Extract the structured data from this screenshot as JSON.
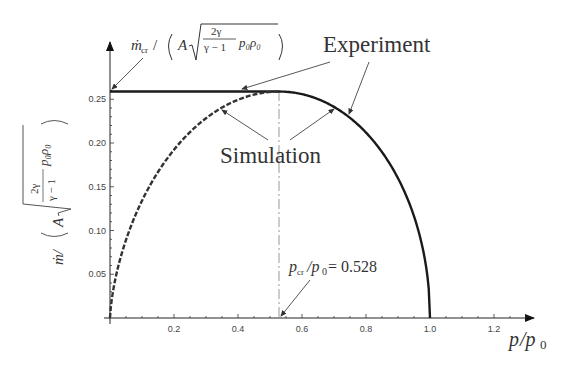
{
  "chart_data": {
    "type": "line",
    "title": "",
    "xlabel": "p/p0",
    "ylabel": "ṁ/(A√(2γ/(γ−1) p0 ρ0))",
    "xlim": [
      0,
      1.3
    ],
    "ylim": [
      0,
      0.27
    ],
    "x_ticks": [
      "0.2",
      "0.4",
      "0.6",
      "0.8",
      "1.0",
      "1.2"
    ],
    "y_ticks": [
      "0.05",
      "0.10",
      "0.15",
      "0.20",
      "0.25"
    ],
    "grid": false,
    "legend": "annotations",
    "series": [
      {
        "name": "Experiment",
        "style": "solid",
        "x": [
          0.0,
          0.1,
          0.2,
          0.3,
          0.4,
          0.5,
          0.528,
          0.6,
          0.7,
          0.8,
          0.9,
          0.95,
          1.0
        ],
        "y": [
          0.2588,
          0.2588,
          0.2588,
          0.2588,
          0.2588,
          0.2588,
          0.2588,
          0.2551,
          0.2385,
          0.2065,
          0.1515,
          0.1092,
          0.0
        ]
      },
      {
        "name": "Simulation",
        "style": "dashed",
        "x": [
          0.0,
          0.05,
          0.1,
          0.2,
          0.3,
          0.4,
          0.5,
          0.528
        ],
        "y": [
          0.0,
          0.0855,
          0.1293,
          0.1893,
          0.2262,
          0.2477,
          0.2581,
          0.2588
        ]
      }
    ],
    "annotations": [
      {
        "text": "Experiment",
        "points_to": [
          "plateau at x≈0.4",
          "curve at x≈0.72"
        ]
      },
      {
        "text": "Simulation",
        "points_to": [
          "dashed curve at x≈0.33",
          "solid curve at x≈0.7"
        ]
      },
      {
        "text": "ṁcr/(A√(2γ/(γ−1) p0ρ0))",
        "points_to": "y≈0.2588 on y-axis"
      },
      {
        "text": "pcr/p0 = 0.528",
        "points_to": "x=0.528 on x-axis"
      }
    ],
    "reference_lines": [
      {
        "type": "vertical",
        "x": 0.528,
        "style": "dash-dot"
      }
    ]
  },
  "labels": {
    "experiment": "Experiment",
    "simulation": "Simulation",
    "mcr_numer": "ṁ",
    "mcr_sub": "cr",
    "pcr_p": "p",
    "pcr_sub": "cr",
    "pcr_rest": "/p",
    "pcr_zero": "0",
    "pcr_value": " = 0.528",
    "frac_num": "2γ",
    "frac_den": "γ − 1",
    "p0rho0": "p",
    "xlabel_p": "p",
    "xlabel_rest": "/p",
    "xlabel_sub": "0",
    "ylabel_m": "ṁ/",
    "A": "A"
  }
}
